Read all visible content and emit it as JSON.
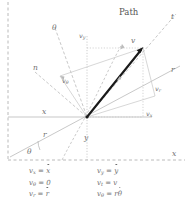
{
  "figure": {
    "title_label": "Path",
    "axes": {
      "x_axis": "x",
      "x_axis_bottom": "x",
      "y_axis": "y",
      "r_axis": "r",
      "r_axis_right": "r",
      "theta_axis": "θ",
      "theta_angle": "θ",
      "n_axis": "n",
      "t_axis": "t"
    },
    "vector": {
      "v_label": "v",
      "vx_label_base": "v",
      "vx_label_sub": "x",
      "vy_label_base": "v",
      "vy_label_sub": "y",
      "vr_label_base": "v",
      "vr_label_sub": "r",
      "vtheta_label_base": "v",
      "vtheta_label_sub": "θ"
    },
    "colors": {
      "vector": "#1a1a1a",
      "construction": "#9a9a9a",
      "label": "#6e6e6e",
      "background": "#ffffff"
    }
  },
  "equations": {
    "left": [
      {
        "lhs_base": "v",
        "lhs_sub": "x",
        "rhs": "x",
        "rhs_dot": true
      },
      {
        "lhs_base": "v",
        "lhs_sub": "θ",
        "rhs": "0",
        "rhs_dot": false
      },
      {
        "lhs_base": "v",
        "lhs_sub": "r",
        "rhs": "r",
        "rhs_dot": true
      }
    ],
    "right": [
      {
        "lhs_base": "v",
        "lhs_sub": "y",
        "rhs": "y",
        "rhs_dot": true
      },
      {
        "lhs_base": "v",
        "lhs_sub": "t",
        "rhs": "v",
        "rhs_dot": false
      },
      {
        "lhs_base": "v",
        "lhs_sub": "θ",
        "rhs": "rθ",
        "rhs_dot": true
      }
    ]
  }
}
